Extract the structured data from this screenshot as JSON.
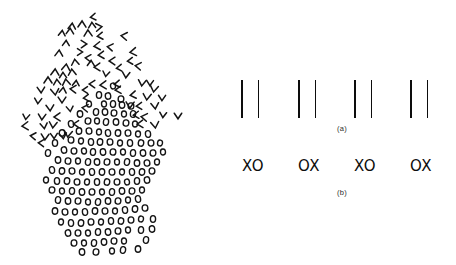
{
  "figure": {
    "background_color": "#ffffff",
    "ink_color": "#0d0d0d",
    "width": 456,
    "height": 265
  },
  "left_panel": {
    "name": "texture-segregation-blob",
    "description_glyphs": {
      "chevron_region": "chevron",
      "circle_region": "circle"
    },
    "chevrons": [
      {
        "x": 93,
        "y": 17,
        "dir": "left"
      },
      {
        "x": 72,
        "y": 26,
        "dir": "up"
      },
      {
        "x": 82,
        "y": 24,
        "dir": "up"
      },
      {
        "x": 92,
        "y": 25,
        "dir": "up"
      },
      {
        "x": 99,
        "y": 27,
        "dir": "right"
      },
      {
        "x": 62,
        "y": 33,
        "dir": "up"
      },
      {
        "x": 70,
        "y": 31,
        "dir": "up"
      },
      {
        "x": 88,
        "y": 33,
        "dir": "up"
      },
      {
        "x": 100,
        "y": 36,
        "dir": "left"
      },
      {
        "x": 124,
        "y": 36,
        "dir": "left"
      },
      {
        "x": 66,
        "y": 43,
        "dir": "up"
      },
      {
        "x": 84,
        "y": 44,
        "dir": "right"
      },
      {
        "x": 97,
        "y": 46,
        "dir": "left"
      },
      {
        "x": 110,
        "y": 47,
        "dir": "left"
      },
      {
        "x": 59,
        "y": 53,
        "dir": "up"
      },
      {
        "x": 80,
        "y": 52,
        "dir": "right"
      },
      {
        "x": 101,
        "y": 55,
        "dir": "left"
      },
      {
        "x": 133,
        "y": 52,
        "dir": "left"
      },
      {
        "x": 88,
        "y": 58,
        "dir": "left"
      },
      {
        "x": 112,
        "y": 61,
        "dir": "left"
      },
      {
        "x": 130,
        "y": 61,
        "dir": "left"
      },
      {
        "x": 75,
        "y": 62,
        "dir": "up"
      },
      {
        "x": 66,
        "y": 67,
        "dir": "up"
      },
      {
        "x": 91,
        "y": 63,
        "dir": "up"
      },
      {
        "x": 97,
        "y": 67,
        "dir": "left"
      },
      {
        "x": 119,
        "y": 68,
        "dir": "left"
      },
      {
        "x": 138,
        "y": 66,
        "dir": "left"
      },
      {
        "x": 55,
        "y": 72,
        "dir": "up"
      },
      {
        "x": 63,
        "y": 75,
        "dir": "up"
      },
      {
        "x": 72,
        "y": 72,
        "dir": "up"
      },
      {
        "x": 106,
        "y": 74,
        "dir": "down"
      },
      {
        "x": 126,
        "y": 75,
        "dir": "down"
      },
      {
        "x": 48,
        "y": 80,
        "dir": "up"
      },
      {
        "x": 57,
        "y": 82,
        "dir": "up"
      },
      {
        "x": 66,
        "y": 82,
        "dir": "up"
      },
      {
        "x": 76,
        "y": 83,
        "dir": "up"
      },
      {
        "x": 92,
        "y": 84,
        "dir": "left"
      },
      {
        "x": 103,
        "y": 85,
        "dir": "left"
      },
      {
        "x": 117,
        "y": 84,
        "dir": "left"
      },
      {
        "x": 142,
        "y": 83,
        "dir": "down"
      },
      {
        "x": 150,
        "y": 83,
        "dir": "down"
      },
      {
        "x": 41,
        "y": 90,
        "dir": "down"
      },
      {
        "x": 55,
        "y": 92,
        "dir": "down"
      },
      {
        "x": 63,
        "y": 90,
        "dir": "up"
      },
      {
        "x": 73,
        "y": 89,
        "dir": "left"
      },
      {
        "x": 85,
        "y": 90,
        "dir": "left"
      },
      {
        "x": 118,
        "y": 90,
        "dir": "left"
      },
      {
        "x": 154,
        "y": 89,
        "dir": "down"
      },
      {
        "x": 38,
        "y": 101,
        "dir": "down"
      },
      {
        "x": 62,
        "y": 100,
        "dir": "down"
      },
      {
        "x": 86,
        "y": 98,
        "dir": "left"
      },
      {
        "x": 133,
        "y": 95,
        "dir": "left"
      },
      {
        "x": 147,
        "y": 97,
        "dir": "down"
      },
      {
        "x": 162,
        "y": 98,
        "dir": "down"
      },
      {
        "x": 50,
        "y": 108,
        "dir": "down"
      },
      {
        "x": 70,
        "y": 109,
        "dir": "down"
      },
      {
        "x": 85,
        "y": 108,
        "dir": "left"
      },
      {
        "x": 130,
        "y": 105,
        "dir": "down"
      },
      {
        "x": 139,
        "y": 106,
        "dir": "left"
      },
      {
        "x": 155,
        "y": 106,
        "dir": "down"
      },
      {
        "x": 26,
        "y": 117,
        "dir": "down"
      },
      {
        "x": 42,
        "y": 117,
        "dir": "down"
      },
      {
        "x": 57,
        "y": 117,
        "dir": "left"
      },
      {
        "x": 136,
        "y": 115,
        "dir": "left"
      },
      {
        "x": 144,
        "y": 117,
        "dir": "left"
      },
      {
        "x": 163,
        "y": 115,
        "dir": "down"
      },
      {
        "x": 178,
        "y": 116,
        "dir": "down"
      },
      {
        "x": 25,
        "y": 126,
        "dir": "left"
      },
      {
        "x": 44,
        "y": 126,
        "dir": "down"
      },
      {
        "x": 53,
        "y": 125,
        "dir": "down"
      },
      {
        "x": 76,
        "y": 124,
        "dir": "left"
      },
      {
        "x": 140,
        "y": 124,
        "dir": "left"
      },
      {
        "x": 155,
        "y": 125,
        "dir": "down"
      },
      {
        "x": 33,
        "y": 136,
        "dir": "left"
      },
      {
        "x": 45,
        "y": 137,
        "dir": "down"
      },
      {
        "x": 54,
        "y": 136,
        "dir": "down"
      },
      {
        "x": 63,
        "y": 136,
        "dir": "down"
      },
      {
        "x": 68,
        "y": 134,
        "dir": "down"
      },
      {
        "x": 41,
        "y": 143,
        "dir": "left"
      }
    ],
    "circles": [
      {
        "x": 113,
        "y": 86
      },
      {
        "x": 99,
        "y": 95
      },
      {
        "x": 108,
        "y": 96
      },
      {
        "x": 121,
        "y": 99
      },
      {
        "x": 104,
        "y": 104
      },
      {
        "x": 113,
        "y": 104
      },
      {
        "x": 122,
        "y": 105
      },
      {
        "x": 131,
        "y": 106
      },
      {
        "x": 89,
        "y": 104
      },
      {
        "x": 96,
        "y": 112
      },
      {
        "x": 105,
        "y": 112
      },
      {
        "x": 114,
        "y": 113
      },
      {
        "x": 124,
        "y": 114
      },
      {
        "x": 133,
        "y": 114
      },
      {
        "x": 80,
        "y": 114
      },
      {
        "x": 88,
        "y": 121
      },
      {
        "x": 97,
        "y": 121
      },
      {
        "x": 106,
        "y": 122
      },
      {
        "x": 116,
        "y": 122
      },
      {
        "x": 126,
        "y": 123
      },
      {
        "x": 135,
        "y": 124
      },
      {
        "x": 71,
        "y": 124
      },
      {
        "x": 79,
        "y": 131
      },
      {
        "x": 89,
        "y": 131
      },
      {
        "x": 99,
        "y": 132
      },
      {
        "x": 108,
        "y": 133
      },
      {
        "x": 118,
        "y": 133
      },
      {
        "x": 128,
        "y": 133
      },
      {
        "x": 138,
        "y": 134
      },
      {
        "x": 148,
        "y": 134
      },
      {
        "x": 62,
        "y": 133
      },
      {
        "x": 71,
        "y": 140
      },
      {
        "x": 81,
        "y": 141
      },
      {
        "x": 91,
        "y": 142
      },
      {
        "x": 100,
        "y": 142
      },
      {
        "x": 110,
        "y": 142
      },
      {
        "x": 120,
        "y": 143
      },
      {
        "x": 130,
        "y": 143
      },
      {
        "x": 141,
        "y": 143
      },
      {
        "x": 151,
        "y": 143
      },
      {
        "x": 160,
        "y": 143
      },
      {
        "x": 55,
        "y": 143
      },
      {
        "x": 64,
        "y": 150
      },
      {
        "x": 74,
        "y": 151
      },
      {
        "x": 84,
        "y": 151
      },
      {
        "x": 93,
        "y": 152
      },
      {
        "x": 103,
        "y": 152
      },
      {
        "x": 113,
        "y": 152
      },
      {
        "x": 123,
        "y": 152
      },
      {
        "x": 133,
        "y": 153
      },
      {
        "x": 143,
        "y": 153
      },
      {
        "x": 153,
        "y": 153
      },
      {
        "x": 163,
        "y": 152
      },
      {
        "x": 48,
        "y": 153
      },
      {
        "x": 58,
        "y": 160
      },
      {
        "x": 68,
        "y": 161
      },
      {
        "x": 78,
        "y": 161
      },
      {
        "x": 88,
        "y": 162
      },
      {
        "x": 97,
        "y": 162
      },
      {
        "x": 107,
        "y": 162
      },
      {
        "x": 117,
        "y": 162
      },
      {
        "x": 127,
        "y": 162
      },
      {
        "x": 137,
        "y": 163
      },
      {
        "x": 147,
        "y": 163
      },
      {
        "x": 157,
        "y": 162
      },
      {
        "x": 52,
        "y": 170
      },
      {
        "x": 62,
        "y": 171
      },
      {
        "x": 72,
        "y": 171
      },
      {
        "x": 82,
        "y": 172
      },
      {
        "x": 92,
        "y": 172
      },
      {
        "x": 102,
        "y": 172
      },
      {
        "x": 112,
        "y": 172
      },
      {
        "x": 122,
        "y": 172
      },
      {
        "x": 132,
        "y": 172
      },
      {
        "x": 142,
        "y": 172
      },
      {
        "x": 152,
        "y": 171
      },
      {
        "x": 46,
        "y": 180
      },
      {
        "x": 57,
        "y": 181
      },
      {
        "x": 67,
        "y": 181
      },
      {
        "x": 77,
        "y": 182
      },
      {
        "x": 87,
        "y": 182
      },
      {
        "x": 97,
        "y": 182
      },
      {
        "x": 107,
        "y": 182
      },
      {
        "x": 117,
        "y": 182
      },
      {
        "x": 127,
        "y": 182
      },
      {
        "x": 137,
        "y": 181
      },
      {
        "x": 147,
        "y": 180
      },
      {
        "x": 52,
        "y": 190
      },
      {
        "x": 62,
        "y": 191
      },
      {
        "x": 72,
        "y": 191
      },
      {
        "x": 82,
        "y": 192
      },
      {
        "x": 92,
        "y": 192
      },
      {
        "x": 102,
        "y": 192
      },
      {
        "x": 112,
        "y": 192
      },
      {
        "x": 122,
        "y": 191
      },
      {
        "x": 132,
        "y": 191
      },
      {
        "x": 142,
        "y": 190
      },
      {
        "x": 58,
        "y": 200
      },
      {
        "x": 68,
        "y": 201
      },
      {
        "x": 78,
        "y": 201
      },
      {
        "x": 88,
        "y": 202
      },
      {
        "x": 98,
        "y": 202
      },
      {
        "x": 108,
        "y": 201
      },
      {
        "x": 118,
        "y": 201
      },
      {
        "x": 128,
        "y": 200
      },
      {
        "x": 138,
        "y": 199
      },
      {
        "x": 55,
        "y": 211
      },
      {
        "x": 65,
        "y": 212
      },
      {
        "x": 75,
        "y": 212
      },
      {
        "x": 85,
        "y": 212
      },
      {
        "x": 95,
        "y": 211
      },
      {
        "x": 105,
        "y": 211
      },
      {
        "x": 115,
        "y": 211
      },
      {
        "x": 125,
        "y": 210
      },
      {
        "x": 135,
        "y": 209
      },
      {
        "x": 145,
        "y": 208
      },
      {
        "x": 61,
        "y": 222
      },
      {
        "x": 71,
        "y": 223
      },
      {
        "x": 81,
        "y": 223
      },
      {
        "x": 91,
        "y": 222
      },
      {
        "x": 101,
        "y": 222
      },
      {
        "x": 111,
        "y": 221
      },
      {
        "x": 121,
        "y": 221
      },
      {
        "x": 131,
        "y": 220
      },
      {
        "x": 141,
        "y": 219
      },
      {
        "x": 153,
        "y": 219
      },
      {
        "x": 68,
        "y": 233
      },
      {
        "x": 78,
        "y": 233
      },
      {
        "x": 88,
        "y": 233
      },
      {
        "x": 98,
        "y": 232
      },
      {
        "x": 108,
        "y": 232
      },
      {
        "x": 118,
        "y": 231
      },
      {
        "x": 128,
        "y": 230
      },
      {
        "x": 141,
        "y": 230
      },
      {
        "x": 152,
        "y": 229
      },
      {
        "x": 74,
        "y": 243
      },
      {
        "x": 84,
        "y": 243
      },
      {
        "x": 94,
        "y": 243
      },
      {
        "x": 104,
        "y": 242
      },
      {
        "x": 114,
        "y": 241
      },
      {
        "x": 124,
        "y": 241
      },
      {
        "x": 146,
        "y": 240
      },
      {
        "x": 82,
        "y": 252
      },
      {
        "x": 96,
        "y": 252
      },
      {
        "x": 112,
        "y": 251
      },
      {
        "x": 123,
        "y": 250
      },
      {
        "x": 138,
        "y": 249
      }
    ]
  },
  "right_panel": {
    "row_a": {
      "label": "(a)",
      "caption": "paired vertical lines",
      "groups": [
        {
          "id": "bar-pair-1",
          "left": 13,
          "inner_gap": 15
        },
        {
          "id": "bar-pair-2",
          "left": 70,
          "inner_gap": 15
        },
        {
          "id": "bar-pair-3",
          "left": 126,
          "inner_gap": 15
        },
        {
          "id": "bar-pair-4",
          "left": 182,
          "inner_gap": 15
        }
      ],
      "bar_count_per_group": 2,
      "bar_color": "#0d0d0d"
    },
    "row_b": {
      "label": "(b)",
      "caption": "paired letters",
      "groups": [
        {
          "id": "xo-pair-1",
          "text": "XO",
          "left": 14
        },
        {
          "id": "xo-pair-2",
          "text": "OX",
          "left": 70
        },
        {
          "id": "xo-pair-3",
          "text": "XO",
          "left": 126
        },
        {
          "id": "xo-pair-4",
          "text": "OX",
          "left": 182
        }
      ],
      "text_color": "#0d0d0d"
    }
  }
}
